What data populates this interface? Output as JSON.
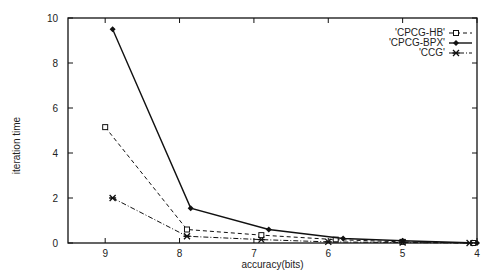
{
  "chart_data": {
    "type": "line",
    "title": "",
    "xlabel": "accuracy(bits)",
    "ylabel": "iteration time",
    "xlim": [
      9.5,
      4
    ],
    "ylim": [
      0,
      10
    ],
    "x_ticks": [
      "9",
      "8",
      "7",
      "6",
      "5",
      "4"
    ],
    "y_ticks": [
      "0",
      "2",
      "4",
      "6",
      "8",
      "10"
    ],
    "grid": false,
    "legend_position": "top-right",
    "series": [
      {
        "name": "'CPCG-HB'",
        "marker": "square",
        "style": "dashed",
        "x": [
          9.0,
          7.9,
          6.9,
          5.9,
          5.0,
          4.05
        ],
        "values": [
          5.15,
          0.6,
          0.35,
          0.15,
          0.05,
          0.0
        ]
      },
      {
        "name": "'CPCG-BPX'",
        "marker": "diamond",
        "style": "solid",
        "x": [
          8.9,
          7.85,
          6.8,
          5.8,
          5.0,
          4.0
        ],
        "values": [
          9.5,
          1.55,
          0.6,
          0.2,
          0.1,
          0.0
        ]
      },
      {
        "name": "'CCG'",
        "marker": "star",
        "style": "dashdot",
        "x": [
          8.9,
          7.9,
          6.9,
          6.0,
          5.0,
          4.1
        ],
        "values": [
          2.0,
          0.3,
          0.15,
          0.05,
          0.02,
          0.0
        ]
      }
    ]
  }
}
